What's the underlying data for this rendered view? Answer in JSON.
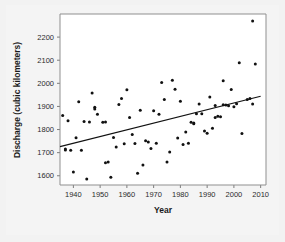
{
  "chart_data": {
    "type": "scatter",
    "title": "",
    "xlabel": "Year",
    "ylabel": "Discharge (cubic kilometers)",
    "xlim": [
      1935,
      2012
    ],
    "ylim": [
      1560,
      2300
    ],
    "xticks": [
      1940,
      1950,
      1960,
      1970,
      1980,
      1990,
      2000,
      2010
    ],
    "yticks": [
      1600,
      1700,
      1800,
      1900,
      2000,
      2100,
      2200
    ],
    "grid": false,
    "legend": null,
    "marker_color": "#111111",
    "trendline": {
      "label": "linear fit",
      "color": "#111111",
      "x": [
        1935,
        2010
      ],
      "y": [
        1726,
        1944
      ]
    },
    "points": [
      {
        "x": 1936,
        "y": 1861
      },
      {
        "x": 1937,
        "y": 1716
      },
      {
        "x": 1937,
        "y": 1711
      },
      {
        "x": 1938,
        "y": 1838
      },
      {
        "x": 1939,
        "y": 1710
      },
      {
        "x": 1940,
        "y": 1616
      },
      {
        "x": 1941,
        "y": 1764
      },
      {
        "x": 1942,
        "y": 1920
      },
      {
        "x": 1943,
        "y": 1710
      },
      {
        "x": 1944,
        "y": 1835
      },
      {
        "x": 1945,
        "y": 1586
      },
      {
        "x": 1946,
        "y": 1833
      },
      {
        "x": 1947,
        "y": 1958
      },
      {
        "x": 1948,
        "y": 1897
      },
      {
        "x": 1948,
        "y": 1889
      },
      {
        "x": 1949,
        "y": 1866
      },
      {
        "x": 1951,
        "y": 1832
      },
      {
        "x": 1952,
        "y": 1833
      },
      {
        "x": 1952,
        "y": 1656
      },
      {
        "x": 1953,
        "y": 1659
      },
      {
        "x": 1954,
        "y": 1594
      },
      {
        "x": 1955,
        "y": 1766
      },
      {
        "x": 1956,
        "y": 1724
      },
      {
        "x": 1957,
        "y": 1908
      },
      {
        "x": 1958,
        "y": 1934
      },
      {
        "x": 1959,
        "y": 1739
      },
      {
        "x": 1960,
        "y": 1972
      },
      {
        "x": 1961,
        "y": 1852
      },
      {
        "x": 1962,
        "y": 1778
      },
      {
        "x": 1963,
        "y": 1740
      },
      {
        "x": 1964,
        "y": 1611
      },
      {
        "x": 1965,
        "y": 1884
      },
      {
        "x": 1966,
        "y": 1647
      },
      {
        "x": 1967,
        "y": 1752
      },
      {
        "x": 1968,
        "y": 1746
      },
      {
        "x": 1969,
        "y": 1718
      },
      {
        "x": 1970,
        "y": 1881
      },
      {
        "x": 1971,
        "y": 1741
      },
      {
        "x": 1972,
        "y": 1866
      },
      {
        "x": 1973,
        "y": 2004
      },
      {
        "x": 1974,
        "y": 1930
      },
      {
        "x": 1975,
        "y": 1660
      },
      {
        "x": 1976,
        "y": 1703
      },
      {
        "x": 1977,
        "y": 2013
      },
      {
        "x": 1978,
        "y": 1974
      },
      {
        "x": 1979,
        "y": 1763
      },
      {
        "x": 1980,
        "y": 1922
      },
      {
        "x": 1981,
        "y": 1735
      },
      {
        "x": 1982,
        "y": 1789
      },
      {
        "x": 1983,
        "y": 1741
      },
      {
        "x": 1984,
        "y": 1832
      },
      {
        "x": 1985,
        "y": 1828
      },
      {
        "x": 1985,
        "y": 1825
      },
      {
        "x": 1986,
        "y": 1868
      },
      {
        "x": 1987,
        "y": 1910
      },
      {
        "x": 1988,
        "y": 1868
      },
      {
        "x": 1989,
        "y": 1794
      },
      {
        "x": 1990,
        "y": 1784
      },
      {
        "x": 1991,
        "y": 1941
      },
      {
        "x": 1992,
        "y": 1806
      },
      {
        "x": 1993,
        "y": 1904
      },
      {
        "x": 1993,
        "y": 1852
      },
      {
        "x": 1994,
        "y": 1857
      },
      {
        "x": 1995,
        "y": 1855
      },
      {
        "x": 1996,
        "y": 2011
      },
      {
        "x": 1996,
        "y": 1907
      },
      {
        "x": 1997,
        "y": 1906
      },
      {
        "x": 1998,
        "y": 1903
      },
      {
        "x": 1999,
        "y": 1973
      },
      {
        "x": 2000,
        "y": 1899
      },
      {
        "x": 2001,
        "y": 1912
      },
      {
        "x": 2002,
        "y": 2089
      },
      {
        "x": 2003,
        "y": 1783
      },
      {
        "x": 2005,
        "y": 1930
      },
      {
        "x": 2006,
        "y": 1934
      },
      {
        "x": 2007,
        "y": 2270
      },
      {
        "x": 2007,
        "y": 1911
      },
      {
        "x": 2008,
        "y": 2084
      }
    ]
  }
}
